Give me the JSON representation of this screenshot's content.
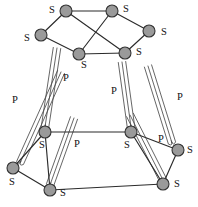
{
  "diagram": {
    "canvas": {
      "width": 198,
      "height": 207
    },
    "colors": {
      "background": "#ffffff",
      "node_fill": "#9a9a9a",
      "node_stroke": "#333333",
      "edge_stroke": "#2b2b2b",
      "hairpin_stroke": "#4a4a4a",
      "label_color": "#111111"
    },
    "nodes": [
      {
        "id": "n1",
        "name": "node-outer-top-left",
        "x": 66,
        "y": 11,
        "r": 6.0
      },
      {
        "id": "n2",
        "name": "node-outer-top-right",
        "x": 112,
        "y": 11,
        "r": 6.0
      },
      {
        "id": "n3",
        "name": "node-outer-upper-left",
        "x": 41,
        "y": 35,
        "r": 6.0
      },
      {
        "id": "n4",
        "name": "node-outer-upper-right",
        "x": 149,
        "y": 31,
        "r": 6.0
      },
      {
        "id": "n5",
        "name": "node-inner-top-left",
        "x": 79,
        "y": 54,
        "r": 6.0
      },
      {
        "id": "n6",
        "name": "node-inner-top-right",
        "x": 125,
        "y": 53,
        "r": 6.0
      },
      {
        "id": "n7",
        "name": "node-inner-bottom-left",
        "x": 45,
        "y": 132,
        "r": 6.0
      },
      {
        "id": "n8",
        "name": "node-inner-bottom-right",
        "x": 131,
        "y": 132,
        "r": 6.0
      },
      {
        "id": "n9",
        "name": "node-outer-lower-left",
        "x": 13,
        "y": 168,
        "r": 6.0
      },
      {
        "id": "n10",
        "name": "node-outer-lower-right",
        "x": 178,
        "y": 150,
        "r": 6.0
      },
      {
        "id": "n11",
        "name": "node-outer-bottom-left",
        "x": 50,
        "y": 190,
        "r": 6.0
      },
      {
        "id": "n12",
        "name": "node-outer-bottom-right",
        "x": 163,
        "y": 184,
        "r": 6.0
      }
    ],
    "straight_edges": [
      {
        "name": "edge-top",
        "from": "n1",
        "to": "n2"
      },
      {
        "name": "edge-top-left-upper",
        "from": "n1",
        "to": "n3"
      },
      {
        "name": "edge-top-right-upper",
        "from": "n2",
        "to": "n4"
      },
      {
        "name": "edge-upper-left-inner",
        "from": "n3",
        "to": "n5"
      },
      {
        "name": "edge-upper-right-inner",
        "from": "n4",
        "to": "n6"
      },
      {
        "name": "edge-inner-top",
        "from": "n5",
        "to": "n6"
      },
      {
        "name": "edge-top-left-inner",
        "from": "n1",
        "to": "n6"
      },
      {
        "name": "edge-top-right-inner",
        "from": "n2",
        "to": "n5"
      },
      {
        "name": "edge-inner-bottom",
        "from": "n7",
        "to": "n8"
      },
      {
        "name": "edge-lower-left-inner",
        "from": "n9",
        "to": "n7"
      },
      {
        "name": "edge-lower-right-inner",
        "from": "n10",
        "to": "n8"
      },
      {
        "name": "edge-bottom-left-outer",
        "from": "n9",
        "to": "n11"
      },
      {
        "name": "edge-bottom-right-outer",
        "from": "n10",
        "to": "n12"
      },
      {
        "name": "edge-bottom",
        "from": "n11",
        "to": "n12"
      },
      {
        "name": "edge-inner-left-bottom",
        "from": "n7",
        "to": "n11"
      },
      {
        "name": "edge-inner-right-bottom",
        "from": "n8",
        "to": "n12"
      }
    ],
    "hairpin_edges": [
      {
        "name": "hairpin-far-left",
        "x1": 20,
        "y1": 163,
        "x2": 61,
        "y2": 72,
        "width": 7.5,
        "strands": 3
      },
      {
        "name": "hairpin-mid-left",
        "x1": 45,
        "y1": 127,
        "x2": 57,
        "y2": 48,
        "width": 7.5,
        "strands": 3
      },
      {
        "name": "hairpin-inner-left",
        "x1": 50,
        "y1": 185,
        "x2": 74,
        "y2": 118,
        "width": 7.5,
        "strands": 3
      },
      {
        "name": "hairpin-mid-right",
        "x1": 131,
        "y1": 127,
        "x2": 122,
        "y2": 62,
        "width": 7.5,
        "strands": 3
      },
      {
        "name": "hairpin-inner-right",
        "x1": 163,
        "y1": 180,
        "x2": 130,
        "y2": 115,
        "width": 7.5,
        "strands": 3
      },
      {
        "name": "hairpin-far-right",
        "x1": 172,
        "y1": 143,
        "x2": 148,
        "y2": 66,
        "width": 7.5,
        "strands": 3
      }
    ],
    "vertex_labels": [
      {
        "name": "label-s-top-left",
        "text": "S",
        "x": 52,
        "y": 11
      },
      {
        "name": "label-s-top-right",
        "text": "S",
        "x": 126,
        "y": 10
      },
      {
        "name": "label-s-upper-left",
        "text": "S",
        "x": 27,
        "y": 39
      },
      {
        "name": "label-s-upper-right",
        "text": "S",
        "x": 164,
        "y": 33
      },
      {
        "name": "label-s-inner-top-left",
        "text": "S",
        "x": 84,
        "y": 66
      },
      {
        "name": "label-s-inner-top-right",
        "text": "S",
        "x": 139,
        "y": 53
      },
      {
        "name": "label-s-inner-bot-left",
        "text": "S",
        "x": 42,
        "y": 146
      },
      {
        "name": "label-s-inner-bot-right",
        "text": "S",
        "x": 127,
        "y": 146
      },
      {
        "name": "label-s-lower-left",
        "text": "S",
        "x": 12,
        "y": 183
      },
      {
        "name": "label-s-lower-right",
        "text": "S",
        "x": 190,
        "y": 151
      },
      {
        "name": "label-s-bottom-left",
        "text": "S",
        "x": 63,
        "y": 194
      },
      {
        "name": "label-s-bottom-right",
        "text": "S",
        "x": 177,
        "y": 185
      }
    ],
    "edge_labels": [
      {
        "name": "label-p-far-left",
        "text": "P",
        "x": 15,
        "y": 101
      },
      {
        "name": "label-p-mid-left",
        "text": "P",
        "x": 66,
        "y": 79
      },
      {
        "name": "label-p-mid-right",
        "text": "P",
        "x": 114,
        "y": 92
      },
      {
        "name": "label-p-far-right",
        "text": "P",
        "x": 180,
        "y": 98
      },
      {
        "name": "label-p-inner-bottom",
        "text": "P",
        "x": 77,
        "y": 145
      },
      {
        "name": "label-p-inner-right",
        "text": "P",
        "x": 161,
        "y": 140
      }
    ]
  }
}
